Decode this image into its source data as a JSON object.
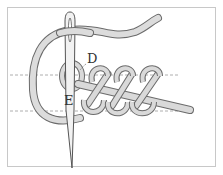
{
  "figure": {
    "type": "embroidery-stitch-illustration",
    "labels": {
      "point_d": "D",
      "point_e": "E"
    },
    "guide_lines": 2,
    "stitch_loops": 4,
    "colors": {
      "frame": "#c8c8c8",
      "thread_fill": "#d9d9d9",
      "thread_outline": "#6b6b6b",
      "needle": "#8a8a8a",
      "guide_line": "#9a9a9a"
    }
  }
}
